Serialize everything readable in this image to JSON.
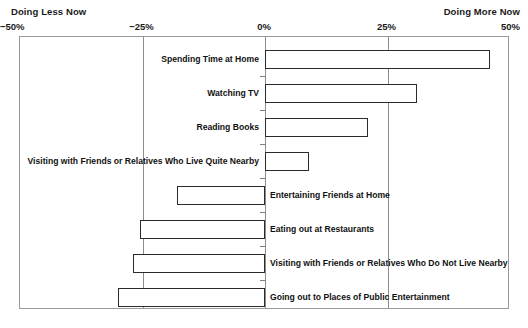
{
  "header": {
    "left_note": "Doing Less Now",
    "right_note": "Doing More Now"
  },
  "axis": {
    "ticks": [
      {
        "label": "−50%",
        "value": -50
      },
      {
        "label": "−25%",
        "value": -25
      },
      {
        "label": "0%",
        "value": 0
      },
      {
        "label": "25%",
        "value": 25
      },
      {
        "label": "50%",
        "value": 50
      }
    ]
  },
  "chart_data": {
    "type": "bar",
    "orientation": "horizontal",
    "title": "",
    "subtitle": "",
    "xlabel": "",
    "ylabel": "",
    "xlim": [
      -50,
      50
    ],
    "grid": true,
    "legend": null,
    "annotations": [
      "Doing Less Now",
      "Doing More Now"
    ],
    "categories": [
      "Spending Time at Home",
      "Watching TV",
      "Reading Books",
      "Visiting with Friends or Relatives Who Live Quite Nearby",
      "Entertaining Friends at Home",
      "Eating out at Restaurants",
      "Visiting with Friends or Relatives Who Do Not Live Nearby",
      "Going out to Places of Public Entertainment"
    ],
    "values": [
      46,
      31,
      21,
      9,
      -18,
      -25.5,
      -27,
      -30
    ],
    "tick_labels": [
      "−50%",
      "−25%",
      "0%",
      "25%",
      "50%"
    ],
    "tick_values": [
      -50,
      -25,
      0,
      25,
      50
    ]
  }
}
